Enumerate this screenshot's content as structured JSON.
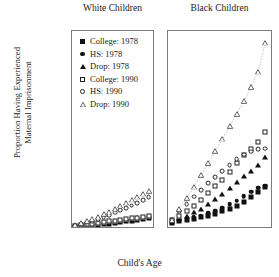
{
  "chart_data": {
    "type": "scatter",
    "title": "",
    "xlabel": "Child's Age",
    "ylabel": "Proportion Having Experienced Maternal Imprisonment",
    "ylabel_line1": "Proportion Having Experienced",
    "ylabel_line2": "Maternal Imprisonment",
    "ylim": [
      0,
      0.053
    ],
    "xlim": [
      0.4,
      14.8
    ],
    "yticks": [
      0,
      0.01,
      0.02,
      0.03,
      0.04,
      0.05
    ],
    "ytick_labels": [
      "0",
      "0.01",
      "0.02",
      "0.03",
      "0.04",
      "0.05"
    ],
    "xticks": [
      2,
      4,
      6,
      8,
      10,
      12,
      14
    ],
    "xtick_labels": [
      "2",
      "4",
      "6",
      "8",
      "10",
      "12",
      "14"
    ],
    "grid": false,
    "legend_position": "top-left of first panel",
    "x": [
      1,
      2,
      3,
      4,
      5,
      6,
      7,
      8,
      9,
      10,
      11,
      12,
      13,
      14
    ],
    "panels": [
      {
        "name": "white-children",
        "title": "White Children",
        "series": [
          {
            "name": "College: 1978",
            "marker": "filled-square",
            "values": [
              0.0002,
              0.0003,
              0.0004,
              0.0005,
              0.0006,
              0.0007,
              0.0009,
              0.0011,
              0.0013,
              0.0015,
              0.0017,
              0.0019,
              0.0021,
              0.0023
            ]
          },
          {
            "name": "HS: 1978",
            "marker": "filled-circle",
            "values": [
              0.0002,
              0.0004,
              0.0005,
              0.0007,
              0.0008,
              0.001,
              0.0012,
              0.0014,
              0.0016,
              0.0018,
              0.002,
              0.0022,
              0.0024,
              0.0026
            ]
          },
          {
            "name": "Drop: 1978",
            "marker": "filled-triangle",
            "values": [
              0.0003,
              0.0005,
              0.0007,
              0.0009,
              0.0011,
              0.0013,
              0.0015,
              0.0017,
              0.002,
              0.0022,
              0.0024,
              0.0026,
              0.0028,
              0.003
            ]
          },
          {
            "name": "College: 1990",
            "marker": "open-square",
            "values": [
              0.0003,
              0.0005,
              0.0007,
              0.0009,
              0.0011,
              0.0013,
              0.0015,
              0.0017,
              0.0019,
              0.0021,
              0.0023,
              0.0025,
              0.0027,
              0.0029
            ]
          },
          {
            "name": "HS: 1990",
            "marker": "open-circle",
            "values": [
              0.0004,
              0.0008,
              0.0012,
              0.0016,
              0.0021,
              0.0026,
              0.0032,
              0.0039,
              0.0045,
              0.0052,
              0.0058,
              0.0064,
              0.0072,
              0.008
            ]
          },
          {
            "name": "Drop: 1990",
            "marker": "open-triangle",
            "values": [
              0.0005,
              0.001,
              0.0015,
              0.0021,
              0.0027,
              0.0034,
              0.0041,
              0.0049,
              0.0057,
              0.0065,
              0.0073,
              0.0081,
              0.0089,
              0.0097
            ]
          }
        ]
      },
      {
        "name": "black-children",
        "title": "Black Children",
        "series": [
          {
            "name": "College: 1978",
            "marker": "filled-square",
            "values": [
              0.0012,
              0.0016,
              0.0019,
              0.0022,
              0.0026,
              0.0031,
              0.0036,
              0.0042,
              0.005,
              0.0058,
              0.0068,
              0.008,
              0.0094,
              0.0108
            ]
          },
          {
            "name": "HS: 1978",
            "marker": "filled-circle",
            "values": [
              0.0013,
              0.0018,
              0.0022,
              0.0026,
              0.0031,
              0.0037,
              0.0044,
              0.0052,
              0.0061,
              0.0071,
              0.0083,
              0.0095,
              0.0106,
              0.0112
            ]
          },
          {
            "name": "Drop: 1978",
            "marker": "filled-triangle",
            "values": [
              0.0016,
              0.0023,
              0.0031,
              0.004,
              0.005,
              0.0062,
              0.0075,
              0.009,
              0.0106,
              0.0122,
              0.0138,
              0.0152,
              0.0168,
              0.019
            ]
          },
          {
            "name": "College: 1990",
            "marker": "open-square",
            "values": [
              0.0018,
              0.003,
              0.0044,
              0.0058,
              0.0074,
              0.0092,
              0.011,
              0.0128,
              0.015,
              0.0172,
              0.0196,
              0.0212,
              0.023,
              0.0258
            ]
          },
          {
            "name": "HS: 1990",
            "marker": "open-circle",
            "values": [
              0.002,
              0.0042,
              0.0062,
              0.0082,
              0.01,
              0.0118,
              0.0136,
              0.0152,
              0.0168,
              0.0184,
              0.0196,
              0.0204,
              0.021,
              0.0212
            ]
          },
          {
            "name": "Drop: 1990",
            "marker": "open-triangle",
            "values": [
              0.002,
              0.0048,
              0.0078,
              0.0108,
              0.014,
              0.0172,
              0.0205,
              0.0238,
              0.0272,
              0.0305,
              0.034,
              0.0378,
              0.042,
              0.0498
            ],
            "trend_line": true
          }
        ]
      }
    ],
    "legend": [
      {
        "label": "College: 1978",
        "marker": "filled-square"
      },
      {
        "label": "HS: 1978",
        "marker": "filled-circle"
      },
      {
        "label": "Drop: 1978",
        "marker": "filled-triangle"
      },
      {
        "label": "College: 1990",
        "marker": "open-square"
      },
      {
        "label": "HS: 1990",
        "marker": "open-circle"
      },
      {
        "label": "Drop: 1990",
        "marker": "open-triangle"
      }
    ]
  }
}
